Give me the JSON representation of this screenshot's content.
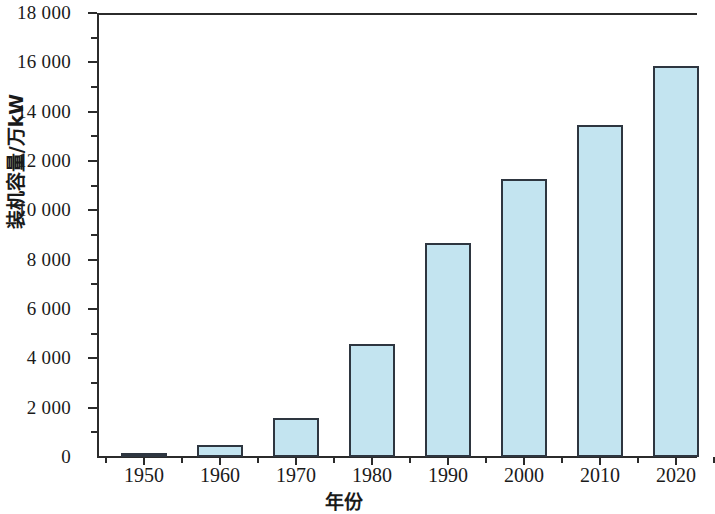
{
  "chart_data": {
    "type": "bar",
    "title": "",
    "subtitle": "",
    "xlabel": "年份",
    "ylabel": "装机容量/万kW",
    "categories": [
      "1950",
      "1960",
      "1970",
      "1980",
      "1990",
      "2000",
      "2010",
      "2020"
    ],
    "values": [
      150,
      470,
      1570,
      4570,
      8660,
      11290,
      13450,
      15850
    ],
    "series": [
      {
        "name": "装机容量",
        "values": [
          150,
          470,
          1570,
          4570,
          8660,
          11290,
          13450,
          15850
        ]
      }
    ],
    "ylim": [
      0,
      18000
    ],
    "ytick_labels": [
      "0",
      "2 000",
      "4 000",
      "6 000",
      "8 000",
      "10 000",
      "12 000",
      "14 000",
      "16 000",
      "18 000"
    ],
    "ytick_values": [
      0,
      2000,
      4000,
      6000,
      8000,
      10000,
      12000,
      14000,
      16000,
      18000
    ],
    "yminor_tick_values": [
      1000,
      3000,
      5000,
      7000,
      9000,
      11000,
      13000,
      15000,
      17000
    ],
    "xtick_labels": [
      "1950",
      "1960",
      "1970",
      "1980",
      "1990",
      "2000",
      "2010",
      "2020"
    ],
    "grid": false,
    "legend": false,
    "legend_position": "none",
    "bar_fill_color": "#c3e4f0",
    "bar_edge_color": "#2e3640",
    "axis_color": "#2b2b2b",
    "background_color": "#ffffff",
    "annotations": []
  }
}
